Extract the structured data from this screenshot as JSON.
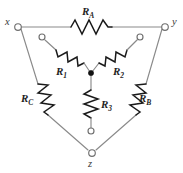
{
  "figure": {
    "kind": "circuit-diagram",
    "background_color": "#ffffff",
    "wire_color": "#8a8a8a",
    "resistor_color": "#1a1a1a",
    "label_color": "#1a1a1a"
  },
  "nodes": [
    {
      "id": "x",
      "label": "x",
      "terminal": "open-circle"
    },
    {
      "id": "y",
      "label": "y",
      "terminal": "open-circle"
    },
    {
      "id": "z",
      "label": "z",
      "terminal": "open-circle"
    },
    {
      "id": "center",
      "label": "",
      "terminal": "filled-dot"
    },
    {
      "id": "t1",
      "label": "",
      "terminal": "open-circle"
    },
    {
      "id": "t2",
      "label": "",
      "terminal": "open-circle"
    },
    {
      "id": "t3",
      "label": "",
      "terminal": "open-circle"
    }
  ],
  "resistors": {
    "delta": [
      {
        "id": "RA",
        "base": "R",
        "sub": "A",
        "edge": "x-y",
        "orientation": "horizontal"
      },
      {
        "id": "RB",
        "base": "R",
        "sub": "B",
        "edge": "y-z",
        "orientation": "diagonal-down-left"
      },
      {
        "id": "RC",
        "base": "R",
        "sub": "C",
        "edge": "x-z",
        "orientation": "diagonal-down-right"
      }
    ],
    "wye": [
      {
        "id": "R1",
        "base": "R",
        "sub": "1",
        "edge": "t1-center",
        "orientation": "diagonal-down-right"
      },
      {
        "id": "R2",
        "base": "R",
        "sub": "2",
        "edge": "center-t2",
        "orientation": "diagonal-up-right"
      },
      {
        "id": "R3",
        "base": "R",
        "sub": "3",
        "edge": "center-t3",
        "orientation": "vertical"
      }
    ]
  }
}
